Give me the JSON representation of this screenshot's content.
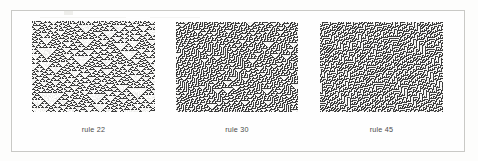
{
  "figure": {
    "background_color": "#fdfdfc",
    "frame_color": "#c9c9c6",
    "caption_color": "#4a4a48",
    "ink_color": "#3c3c3c",
    "paper_color": "#f4f4f2"
  },
  "panels": [
    {
      "id": "rule-22",
      "caption": "rule 22",
      "rule_number": 22,
      "rule_binary": "00010110",
      "initial_condition": "random",
      "cells_wide": 123,
      "generations": 91,
      "density": 0.35,
      "appearance": "nested white triangles on dark speckled ground"
    },
    {
      "id": "rule-30",
      "caption": "rule 30",
      "rule_number": 30,
      "rule_binary": "00011110",
      "initial_condition": "random",
      "cells_wide": 122,
      "generations": 90,
      "density": 0.5,
      "appearance": "dense chaotic texture with small scattered white triangles"
    },
    {
      "id": "rule-45",
      "caption": "rule 45",
      "rule_number": 45,
      "rule_binary": "00101101",
      "initial_condition": "random",
      "cells_wide": 123,
      "generations": 90,
      "density": 0.5,
      "appearance": "chaotic texture with left-leaning diagonal striations"
    }
  ],
  "chart_data": {
    "type": "heatmap",
    "title": "",
    "xlabel": "",
    "ylabel": "",
    "legend": [],
    "grid": false,
    "series": [
      {
        "name": "rule 22",
        "rule": 22,
        "values": [
          0,
          0,
          0,
          1,
          0,
          1,
          1,
          0
        ]
      },
      {
        "name": "rule 30",
        "rule": 30,
        "values": [
          0,
          0,
          0,
          1,
          1,
          1,
          1,
          0
        ]
      },
      {
        "name": "rule 45",
        "rule": 45,
        "values": [
          0,
          0,
          1,
          0,
          1,
          1,
          0,
          1
        ]
      }
    ],
    "categories": [
      "111",
      "110",
      "101",
      "100",
      "011",
      "010",
      "001",
      "000"
    ],
    "note": "Elementary cellular automata space-time diagrams, random initial rows, time increasing downward."
  }
}
